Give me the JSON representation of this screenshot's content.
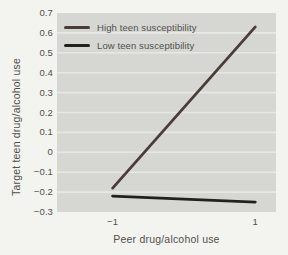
{
  "figure": {
    "background": "#f3f4f0",
    "plot_background": "#d6d7d3",
    "gridline_color": "#e7e8e4",
    "text_color": "#514f4c"
  },
  "chart_data": {
    "type": "line",
    "title": "",
    "xlabel": "Peer drug/alcohol use",
    "ylabel": "Target teen drug/alcohol use",
    "xlim": [
      -1.78,
      1.29
    ],
    "ylim": [
      -0.3,
      0.7
    ],
    "xticks": [
      -1,
      1
    ],
    "xtick_labels": [
      "−1",
      "1"
    ],
    "yticks": [
      0.7,
      0.6,
      0.5,
      0.4,
      0.3,
      0.2,
      0.1,
      0,
      -0.1,
      -0.2,
      -0.3
    ],
    "ytick_labels": [
      "0.7",
      "0.6",
      "0.5",
      "0.4",
      "0.3",
      "0.2",
      "0.1",
      "0",
      "−0.1",
      "−0.2",
      "−0.3"
    ],
    "grid": "horizontal-only",
    "legend_position": "top-left-inside",
    "x": [
      -1,
      1
    ],
    "series": [
      {
        "name": "High teen susceptibility",
        "values": [
          -0.18,
          0.63
        ],
        "color": "#493d38"
      },
      {
        "name": "Low teen susceptibility",
        "values": [
          -0.22,
          -0.25
        ],
        "color": "#23211e"
      }
    ]
  }
}
